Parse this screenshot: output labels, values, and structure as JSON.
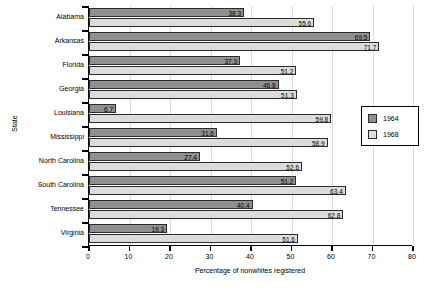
{
  "chart_data": {
    "type": "bar",
    "orientation": "horizontal",
    "title": "",
    "xlabel": "Percentage of nonwhites registered",
    "ylabel": "State",
    "xlim": [
      0,
      80
    ],
    "xticks": [
      0,
      10,
      20,
      30,
      40,
      50,
      60,
      70,
      80
    ],
    "grid": "vertical",
    "legend_position": "right",
    "categories": [
      "Alabama",
      "Arkansas",
      "Florida",
      "Georgia",
      "Louisiana",
      "Mississippi",
      "North Carolina",
      "South Carolina",
      "Tennessee",
      "Virginia"
    ],
    "series": [
      {
        "name": "1964",
        "color": "#8f8f8f",
        "values": [
          38.3,
          69.5,
          37.3,
          46.8,
          6.7,
          31.6,
          27.4,
          51.2,
          40.4,
          19.3
        ]
      },
      {
        "name": "1968",
        "color": "#dcdcdc",
        "values": [
          55.6,
          71.7,
          51.2,
          51.3,
          59.8,
          58.9,
          52.6,
          63.4,
          62.8,
          51.6
        ]
      }
    ]
  },
  "legend": {
    "entries": [
      {
        "label": "1964"
      },
      {
        "label": "1968"
      }
    ]
  }
}
